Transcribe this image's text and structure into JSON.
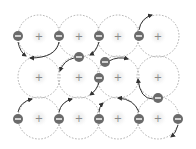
{
  "diagram": {
    "colors": {
      "background": "#ffffff",
      "ion_outline": "#9a9a9a",
      "ion_glow": "#ececec",
      "plus_sign": "#8a8a8a",
      "electron_fill": "#6b6b6b",
      "electron_minus": "#ffffff",
      "arrow": "#333333"
    },
    "ion_radius": 21,
    "ions": [
      {
        "x": 39,
        "y": 36,
        "label": "+"
      },
      {
        "x": 79,
        "y": 36,
        "label": "+"
      },
      {
        "x": 118,
        "y": 36,
        "label": "+"
      },
      {
        "x": 158,
        "y": 36,
        "label": "+"
      },
      {
        "x": 39,
        "y": 77,
        "label": "+"
      },
      {
        "x": 79,
        "y": 77,
        "label": "+"
      },
      {
        "x": 118,
        "y": 77,
        "label": "+"
      },
      {
        "x": 158,
        "y": 77,
        "label": "+"
      },
      {
        "x": 39,
        "y": 118,
        "label": "+"
      },
      {
        "x": 79,
        "y": 118,
        "label": "+"
      },
      {
        "x": 118,
        "y": 118,
        "label": "+"
      },
      {
        "x": 158,
        "y": 118,
        "label": "+"
      }
    ],
    "electrons": [
      {
        "x": 18,
        "y": 36,
        "label": "−"
      },
      {
        "x": 59,
        "y": 36,
        "label": "−"
      },
      {
        "x": 99,
        "y": 36,
        "label": "−"
      },
      {
        "x": 139,
        "y": 36,
        "label": "−"
      },
      {
        "x": 79,
        "y": 57,
        "label": "−"
      },
      {
        "x": 105,
        "y": 62,
        "label": "−"
      },
      {
        "x": 99,
        "y": 78,
        "label": "−"
      },
      {
        "x": 158,
        "y": 98,
        "label": "−"
      },
      {
        "x": 18,
        "y": 119,
        "label": "−"
      },
      {
        "x": 59,
        "y": 119,
        "label": "−"
      },
      {
        "x": 99,
        "y": 119,
        "label": "−"
      },
      {
        "x": 139,
        "y": 119,
        "label": "−"
      },
      {
        "x": 178,
        "y": 119,
        "label": "−"
      }
    ],
    "arrows": [
      {
        "d": "M18,42 Q20,52 26,56"
      },
      {
        "d": "M59,42 Q56,58 30,58"
      },
      {
        "d": "M74,58 Q64,60 60,71"
      },
      {
        "d": "M99,42 Q96,52 90,55"
      },
      {
        "d": "M109,61 Q118,56 128,59"
      },
      {
        "d": "M139,30 Q141,18 152,15"
      },
      {
        "d": "M99,82 Q97,90 90,95"
      },
      {
        "d": "M153,99 Q140,99 138,79"
      },
      {
        "d": "M18,112 Q20,102 32,99"
      },
      {
        "d": "M59,112 Q61,102 72,99"
      },
      {
        "d": "M99,112 Q99,107 103,103"
      },
      {
        "d": "M139,112 Q134,99 118,98"
      },
      {
        "d": "M178,125 Q176,133 171,137"
      }
    ]
  }
}
